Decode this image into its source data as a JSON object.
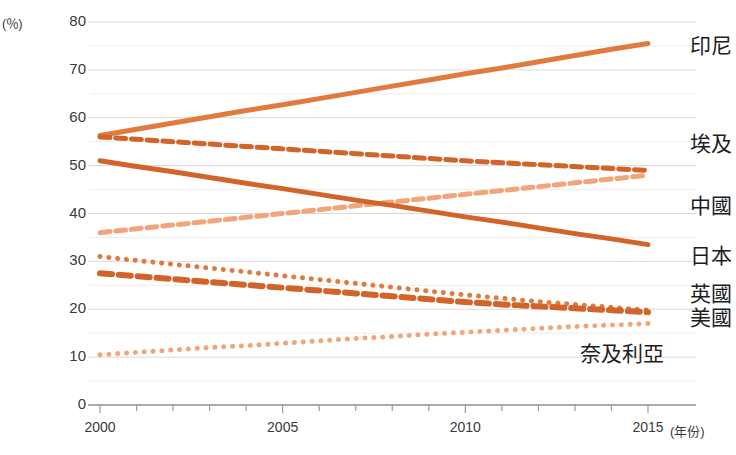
{
  "chart_data": {
    "type": "line",
    "title": "",
    "subtitle": "",
    "xlabel": "(年份)",
    "ylabel": "(％)",
    "unit_label": "(％)",
    "xlim": [
      2000,
      2015
    ],
    "ylim": [
      0,
      80
    ],
    "y_major_ticks": [
      0,
      10,
      20,
      30,
      40,
      50,
      60,
      70,
      80
    ],
    "y_minor_ticks": [
      5,
      15,
      25,
      35,
      45,
      55,
      65,
      75
    ],
    "x_tick_labels": [
      "2000",
      "2005",
      "2010",
      "2015"
    ],
    "x_tick_values": [
      2000,
      2005,
      2010,
      2015
    ],
    "x_minor_tick_values": [
      2001,
      2002,
      2003,
      2004,
      2006,
      2007,
      2008,
      2009,
      2011,
      2012,
      2013,
      2014
    ],
    "grid": "horizontal",
    "legend_position": "right-inline",
    "x": [
      2000,
      2001,
      2002,
      2003,
      2004,
      2005,
      2006,
      2007,
      2008,
      2009,
      2010,
      2011,
      2012,
      2013,
      2014,
      2015
    ],
    "series": [
      {
        "name": "印尼",
        "label": "印尼",
        "style": "solid",
        "color": "#e07b3f",
        "width": 5,
        "label_y_pct": 75.5,
        "values": [
          56.3,
          57.6,
          58.9,
          60.2,
          61.5,
          62.7,
          64.0,
          65.3,
          66.6,
          67.9,
          69.2,
          70.4,
          71.7,
          73.0,
          74.3,
          75.5
        ]
      },
      {
        "name": "埃及",
        "label": "埃及",
        "style": "dashed",
        "color": "#d2642a",
        "width": 5,
        "label_y_pct": 55.0,
        "values": [
          56.0,
          55.5,
          55.0,
          54.5,
          54.0,
          53.5,
          53.0,
          52.5,
          52.0,
          51.5,
          51.0,
          50.6,
          50.2,
          49.8,
          49.4,
          49.0
        ]
      },
      {
        "name": "中國",
        "label": "中國",
        "style": "dashed",
        "color": "#f0a678",
        "width": 5,
        "label_y_pct": 42.0,
        "values": [
          36.0,
          36.8,
          37.6,
          38.4,
          39.2,
          40.0,
          40.8,
          41.6,
          42.4,
          43.2,
          44.0,
          44.8,
          45.6,
          46.4,
          47.2,
          48.0
        ]
      },
      {
        "name": "日本",
        "label": "日本",
        "style": "solid",
        "color": "#d2642a",
        "width": 5,
        "label_y_pct": 31.5,
        "values": [
          51.0,
          49.8,
          48.7,
          47.5,
          46.3,
          45.2,
          44.0,
          42.8,
          41.7,
          40.5,
          39.3,
          38.2,
          37.0,
          35.8,
          34.7,
          33.5
        ]
      },
      {
        "name": "英國",
        "label": "英國",
        "style": "dotted",
        "color": "#e07b3f",
        "width": 5,
        "label_y_pct": 23.5,
        "values": [
          31.0,
          30.2,
          29.4,
          28.6,
          27.8,
          27.0,
          26.2,
          25.4,
          24.6,
          23.8,
          23.0,
          22.3,
          21.6,
          21.0,
          20.4,
          19.8
        ]
      },
      {
        "name": "美國",
        "label": "美國",
        "style": "dashed",
        "color": "#d2642a",
        "width": 6,
        "label_y_pct": 18.5,
        "values": [
          27.5,
          26.9,
          26.3,
          25.7,
          25.1,
          24.5,
          23.9,
          23.3,
          22.7,
          22.1,
          21.5,
          21.0,
          20.6,
          20.2,
          19.8,
          19.4
        ]
      },
      {
        "name": "奈及利亞",
        "label": "奈及利亞",
        "style": "dotted",
        "color": "#f0a678",
        "width": 5,
        "label_y_pct": 11.0,
        "values": [
          10.5,
          11.0,
          11.5,
          12.0,
          12.4,
          12.9,
          13.4,
          13.9,
          14.3,
          14.8,
          15.2,
          15.6,
          16.0,
          16.4,
          16.7,
          17.0
        ]
      }
    ]
  },
  "axes": {
    "y_unit_text": "(％)",
    "x_unit_text": "(年份)"
  },
  "colors": {
    "accent_dark": "#d2642a",
    "accent_mid": "#e07b3f",
    "accent_light": "#f0a678",
    "grid": "#d9d9d9",
    "axis": "#9a9a9a",
    "text": "#3a3a3a"
  }
}
